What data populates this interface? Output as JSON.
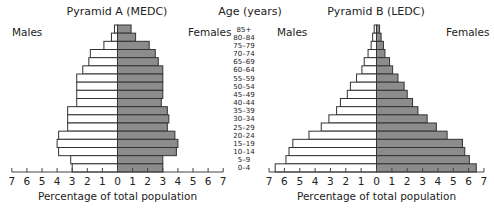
{
  "chart_data": [
    {
      "type": "bar",
      "orientation": "horizontal-population-pyramid",
      "title": "Pyramid A (MEDC)",
      "xlabel": "Percentage of total population",
      "ylabel": "Age (years)",
      "left_label": "Males",
      "right_label": "Females",
      "xlim": [
        -7,
        7
      ],
      "xticks": [
        7,
        6,
        5,
        4,
        3,
        2,
        1,
        0,
        1,
        2,
        3,
        4,
        5,
        6,
        7
      ],
      "categories": [
        "85+",
        "80–84",
        "75–79",
        "70–74",
        "65–69",
        "60–64",
        "55–59",
        "50–54",
        "45–49",
        "40–44",
        "35–39",
        "30–34",
        "25–29",
        "20–24",
        "15–19",
        "10–14",
        "5–9",
        "0–4"
      ],
      "series": [
        {
          "name": "Males",
          "color": "#ffffff",
          "values": [
            0.2,
            0.4,
            0.9,
            1.8,
            1.9,
            2.3,
            2.7,
            2.7,
            2.7,
            2.7,
            3.3,
            3.3,
            3.3,
            3.9,
            4.0,
            3.9,
            3.1,
            3.0
          ]
        },
        {
          "name": "Females",
          "color": "#8c8c8c",
          "values": [
            0.9,
            1.2,
            2.1,
            2.5,
            2.7,
            3.0,
            3.0,
            3.0,
            3.0,
            2.9,
            3.3,
            3.4,
            3.3,
            3.8,
            4.0,
            3.9,
            3.0,
            3.0
          ]
        }
      ]
    },
    {
      "type": "bar",
      "orientation": "horizontal-population-pyramid",
      "title": "Pyramid B (LEDC)",
      "xlabel": "Percentage of total population",
      "ylabel": "Age (years)",
      "left_label": "Males",
      "right_label": "Females",
      "xlim": [
        -7,
        7
      ],
      "xticks": [
        7,
        6,
        5,
        4,
        3,
        2,
        1,
        0,
        1,
        2,
        3,
        4,
        5,
        6,
        7
      ],
      "categories": [
        "85+",
        "80–84",
        "75–79",
        "70–74",
        "65–69",
        "60–64",
        "55–59",
        "50–54",
        "45–49",
        "40–44",
        "35–39",
        "30–34",
        "25–29",
        "20–24",
        "15–19",
        "10–14",
        "5–9",
        "0–4"
      ],
      "series": [
        {
          "name": "Males",
          "color": "#ffffff",
          "values": [
            0.15,
            0.25,
            0.35,
            0.55,
            0.8,
            0.95,
            1.3,
            1.7,
            1.9,
            2.35,
            2.6,
            3.1,
            3.6,
            4.4,
            5.45,
            5.7,
            5.9,
            6.6
          ]
        },
        {
          "name": "Females",
          "color": "#8c8c8c",
          "values": [
            0.2,
            0.3,
            0.45,
            0.55,
            0.85,
            1.05,
            1.4,
            1.8,
            2.0,
            2.35,
            2.7,
            3.3,
            3.9,
            4.6,
            5.6,
            5.75,
            6.05,
            6.5
          ]
        }
      ]
    }
  ],
  "age_axis": {
    "title": "Age (years)",
    "labels": [
      "85+",
      "80–84",
      "75–79",
      "70–74",
      "65–69",
      "60–64",
      "55–59",
      "50–54",
      "45–49",
      "40–44",
      "35–39",
      "30–34",
      "25–29",
      "20–24",
      "15–19",
      "10–14",
      "5–9",
      "0–4"
    ]
  },
  "style": {
    "male_fill": "#ffffff",
    "female_fill": "#8c8c8c",
    "bar_stroke": "#333333",
    "axis_color": "#444444"
  }
}
